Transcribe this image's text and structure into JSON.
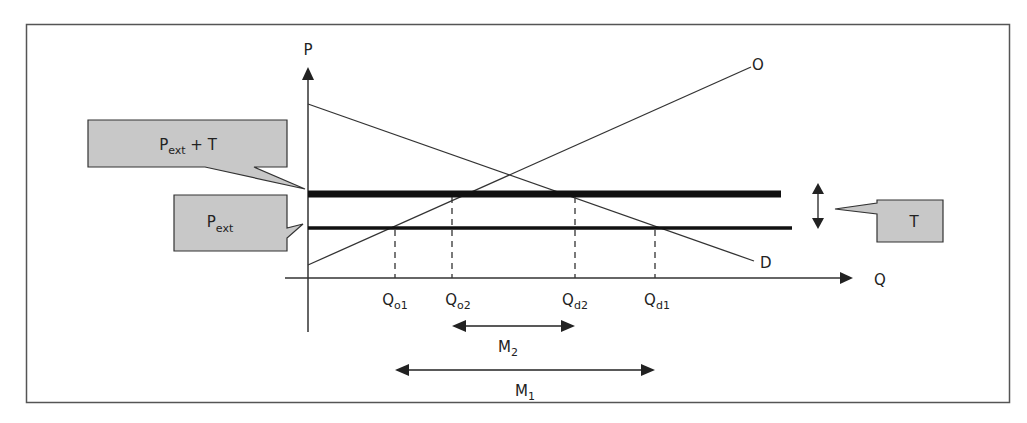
{
  "diagram": {
    "type": "supply-demand-tariff",
    "axes": {
      "y_label": "P",
      "x_label": "Q"
    },
    "curves": {
      "supply_label": "O",
      "demand_label": "D"
    },
    "price_lines": {
      "world_price": {
        "base": "P",
        "sub": "ext"
      },
      "world_price_plus_tariff": {
        "base": "P",
        "sub": "ext",
        "suffix": " + T"
      }
    },
    "tariff_label": "T",
    "quantities": [
      {
        "base": "Q",
        "sub": "o1"
      },
      {
        "base": "Q",
        "sub": "o2"
      },
      {
        "base": "Q",
        "sub": "d2"
      },
      {
        "base": "Q",
        "sub": "d1"
      }
    ],
    "imports": [
      {
        "base": "M",
        "sub": "2"
      },
      {
        "base": "M",
        "sub": "1"
      }
    ],
    "colors": {
      "line": "#222222",
      "callout_fill": "#c8c8c8",
      "frame": "#555555"
    }
  }
}
